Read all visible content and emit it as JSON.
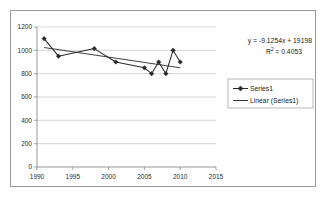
{
  "chart_data": {
    "type": "line",
    "title": "",
    "xlabel": "",
    "ylabel": "",
    "xlim": [
      1990,
      2015
    ],
    "ylim": [
      0,
      1200
    ],
    "grid": true,
    "legend_position": "right",
    "x_ticks": [
      "1990",
      "1995",
      "2000",
      "2005",
      "2010",
      "2015"
    ],
    "x_tick_values": [
      1990,
      1995,
      2000,
      2005,
      2010,
      2015
    ],
    "y_ticks": [
      "0",
      "200",
      "400",
      "600",
      "800",
      "1000",
      "1200"
    ],
    "y_tick_values": [
      0,
      200,
      400,
      600,
      800,
      1000,
      1200
    ],
    "series": [
      {
        "name": "Series1",
        "type": "line-markers",
        "marker": "diamond",
        "color": "#2a2a2a",
        "x": [
          1991,
          1993,
          1998,
          2001,
          2005,
          2006,
          2007,
          2008,
          2009,
          2010
        ],
        "values": [
          1100,
          950,
          1015,
          900,
          850,
          800,
          900,
          800,
          1000,
          900
        ]
      },
      {
        "name": "Linear (Series1)",
        "type": "trendline",
        "color": "#2a2a2a",
        "slope": -9.1254,
        "intercept": 19198,
        "x_start": 1991,
        "x_end": 2010,
        "y_start": 1024.1,
        "y_end": 850.7
      }
    ],
    "annotations": {
      "equation_prefix": "y = -9.1254x + 19198",
      "r2_prefix": "R",
      "r2_superscript": "2",
      "r2_value": " = 0.4053"
    }
  },
  "legend": {
    "items": [
      {
        "label": "Series1",
        "marker": "diamond-line"
      },
      {
        "label": "Linear (Series1)",
        "marker": "line"
      }
    ]
  }
}
